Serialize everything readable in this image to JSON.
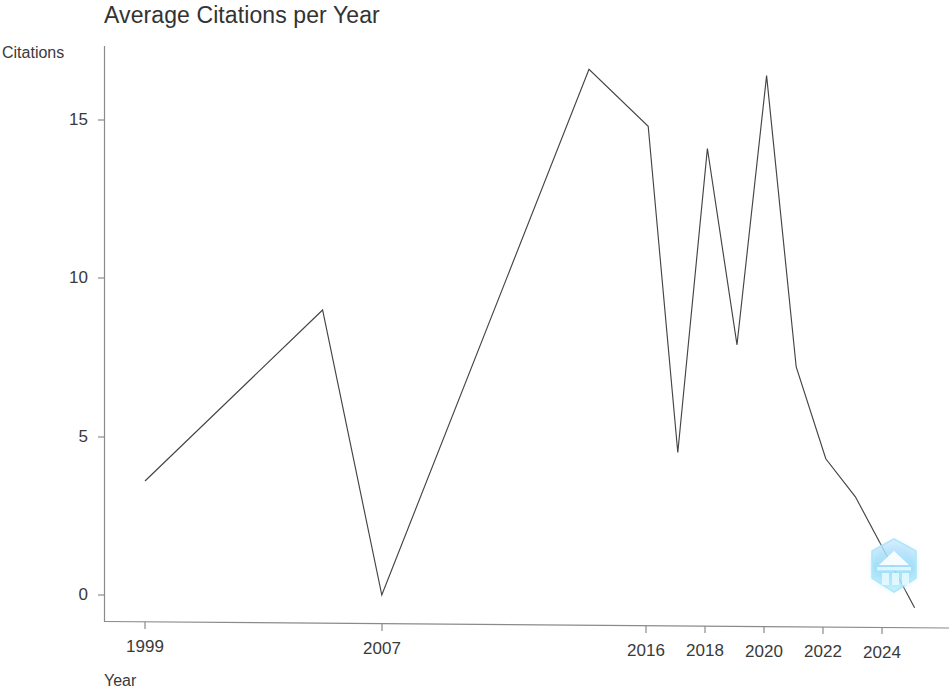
{
  "chart": {
    "title": "Average Citations per Year",
    "xlabel": "Year",
    "ylabel": "Citations"
  },
  "axis": {
    "y_ticks": [
      "15",
      "10",
      "5",
      "0"
    ],
    "x_ticks": [
      "1999",
      "2007",
      "2016",
      "2018",
      "2020",
      "2022",
      "2024"
    ]
  },
  "watermark": {
    "name": "hexagon-mountain-logo",
    "color": "#7fd8f7"
  },
  "style": {
    "line_color": "#444444",
    "axis_color": "#8a8a8a",
    "text_color": "#3a3a3a",
    "background": "#ffffff"
  },
  "chart_data": {
    "type": "line",
    "title": "Average Citations per Year",
    "xlabel": "Year",
    "ylabel": "Citations",
    "xlim": [
      1999,
      2025
    ],
    "ylim": [
      0,
      17.4
    ],
    "grid": false,
    "legend": null,
    "x_tick_labels": [
      "1999",
      "2007",
      "2016",
      "2018",
      "2020",
      "2022",
      "2024"
    ],
    "x_tick_values": [
      1999,
      2007,
      2016,
      2018,
      2020,
      2022,
      2024
    ],
    "y_tick_labels": [
      "0",
      "5",
      "10",
      "15"
    ],
    "y_tick_values": [
      0,
      5,
      10,
      15
    ],
    "x": [
      1999,
      2005,
      2007,
      2014,
      2016,
      2017,
      2018,
      2019,
      2020,
      2021,
      2022,
      2023,
      2025
    ],
    "values": [
      3.6,
      9.0,
      0.0,
      16.6,
      14.8,
      4.5,
      14.1,
      7.9,
      16.4,
      7.2,
      4.3,
      3.1,
      -0.4
    ],
    "series": [
      {
        "name": "Average Citations per Year",
        "points": [
          {
            "year": 1999,
            "citations": 3.6
          },
          {
            "year": 2005,
            "citations": 9.0
          },
          {
            "year": 2007,
            "citations": 0.0
          },
          {
            "year": 2014,
            "citations": 16.6
          },
          {
            "year": 2016,
            "citations": 14.8
          },
          {
            "year": 2017,
            "citations": 4.5
          },
          {
            "year": 2018,
            "citations": 14.1
          },
          {
            "year": 2019,
            "citations": 7.9
          },
          {
            "year": 2020,
            "citations": 16.4
          },
          {
            "year": 2021,
            "citations": 7.2
          },
          {
            "year": 2022,
            "citations": 4.3
          },
          {
            "year": 2023,
            "citations": 3.1
          },
          {
            "year": 2025,
            "citations": -0.4
          }
        ]
      }
    ]
  },
  "geometry": {
    "origin_x": 145,
    "origin_y": 595,
    "px_per_year": 29.6,
    "px_per_unit": 31.67,
    "axis_top": 46,
    "axis_right": 949
  }
}
